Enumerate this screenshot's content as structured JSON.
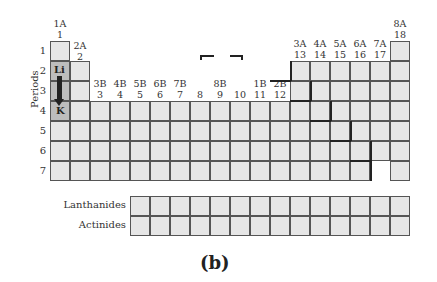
{
  "groups": [
    {
      "a": "1A",
      "n": "1"
    },
    {
      "a": "2A",
      "n": "2"
    },
    {
      "a": "3B",
      "n": "3"
    },
    {
      "a": "4B",
      "n": "4"
    },
    {
      "a": "5B",
      "n": "5"
    },
    {
      "a": "6B",
      "n": "6"
    },
    {
      "a": "7B",
      "n": "7"
    },
    {
      "a": "",
      "n": "8"
    },
    {
      "a": "8B",
      "n": "9"
    },
    {
      "a": "",
      "n": "10"
    },
    {
      "a": "1B",
      "n": "11"
    },
    {
      "a": "2B",
      "n": "12"
    },
    {
      "a": "3A",
      "n": "13"
    },
    {
      "a": "4A",
      "n": "14"
    },
    {
      "a": "5A",
      "n": "15"
    },
    {
      "a": "6A",
      "n": "16"
    },
    {
      "a": "7A",
      "n": "17"
    },
    {
      "a": "8A",
      "n": "18"
    }
  ],
  "periods": [
    "1",
    "2",
    "3",
    "4",
    "5",
    "6",
    "7"
  ],
  "axis_label": "Periods",
  "elements": {
    "li": "Li",
    "k": "K"
  },
  "series": {
    "lanthanides": "Lanthanides",
    "actinides": "Actinides"
  },
  "caption": "(b)"
}
